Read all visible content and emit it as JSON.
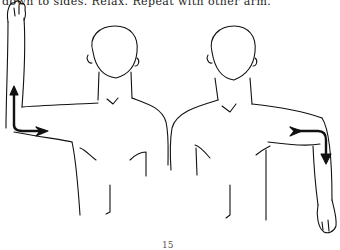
{
  "document": {
    "instruction_text": "down to sides. Relax. Repeat with other arm.",
    "page_number": "15"
  },
  "illustration": {
    "description": "Two line drawings of a man's upper body demonstrating shoulder rotation exercise",
    "figures": [
      {
        "position": "left",
        "pose": "right arm raised with elbow bent 90 degrees, forearm pointing up",
        "arrow": "arrow-rotate-up-icon"
      },
      {
        "position": "right",
        "pose": "left arm abducted with elbow bent 90 degrees, forearm pointing down",
        "arrow": "arrow-rotate-down-icon"
      }
    ],
    "line_color": "#111111",
    "background": "#ffffff"
  }
}
